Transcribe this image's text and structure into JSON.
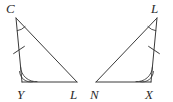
{
  "figure": {
    "stroke_color": "#3a3a3a",
    "label_color": "#2b2b2b",
    "background_color": "#ffffff"
  },
  "triangles": [
    {
      "id": "left-triangle",
      "name": "triangle-CYL",
      "vertices": [
        {
          "key": "C",
          "label": "C",
          "x": 16,
          "y": 18,
          "label_x": 6,
          "label_y": 13
        },
        {
          "key": "Y",
          "label": "Y",
          "x": 22,
          "y": 82,
          "label_x": 17,
          "label_y": 99
        },
        {
          "key": "L",
          "label": "L",
          "x": 77,
          "y": 82,
          "label_x": 70,
          "label_y": 99
        }
      ],
      "angle_marks": [
        {
          "at": "C",
          "name": "angle-arc-C",
          "arcs": 1
        },
        {
          "at": "Y",
          "name": "angle-arc-Y",
          "arcs": 2
        }
      ],
      "side_marks": [
        {
          "side": "C-Y",
          "name": "tick-mark-CY",
          "ticks": 1
        }
      ]
    },
    {
      "id": "right-triangle",
      "name": "triangle-LNX",
      "vertices": [
        {
          "key": "L",
          "label": "L",
          "x": 157,
          "y": 18,
          "label_x": 151,
          "label_y": 13
        },
        {
          "key": "N",
          "label": "N",
          "x": 96,
          "y": 82,
          "label_x": 90,
          "label_y": 99
        },
        {
          "key": "X",
          "label": "X",
          "x": 151,
          "y": 82,
          "label_x": 145,
          "label_y": 99
        }
      ],
      "angle_marks": [
        {
          "at": "L",
          "name": "angle-arc-L",
          "arcs": 1
        },
        {
          "at": "X",
          "name": "angle-arc-X",
          "arcs": 2
        }
      ],
      "side_marks": [
        {
          "side": "L-X",
          "name": "tick-mark-LX",
          "ticks": 1
        }
      ]
    }
  ],
  "labels": {
    "left_apex": "C",
    "left_base_left": "Y",
    "left_base_right": "L",
    "right_apex": "L",
    "right_base_left": "N",
    "right_base_right": "X"
  }
}
